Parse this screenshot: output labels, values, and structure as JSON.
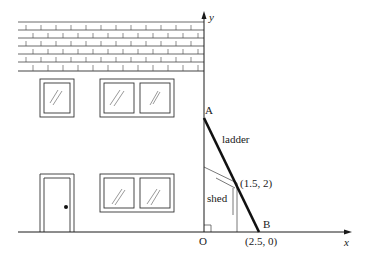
{
  "diagram": {
    "type": "coordinate geometry illustration",
    "axes": {
      "x_label": "x",
      "y_label": "y",
      "origin_label": "O"
    },
    "points": [
      {
        "name": "A",
        "label": "A",
        "description": "top of ladder on the y-axis (house wall)"
      },
      {
        "name": "B",
        "label": "B",
        "coords_label": "(2.5, 0)",
        "description": "foot of ladder on the ground"
      },
      {
        "name": "shed_corner",
        "label": "(1.5, 2)",
        "description": "point where ladder touches shed roof"
      }
    ],
    "labels": {
      "ladder": "ladder",
      "shed": "shed",
      "point_A": "A",
      "point_B": "B",
      "coords_B": "(2.5, 0)",
      "coords_shed": "(1.5, 2)",
      "origin": "O",
      "x_axis": "x",
      "y_axis": "y"
    },
    "house": {
      "roof": "tiled (brick pattern), 6 rows",
      "upper_windows": 3,
      "lower_windows": 2,
      "door": 1
    },
    "colors": {
      "line": "#1a1a1a",
      "thin_line": "#555555",
      "background": "#ffffff"
    }
  }
}
